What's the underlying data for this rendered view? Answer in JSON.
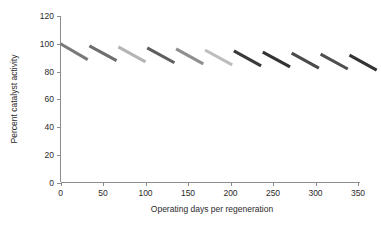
{
  "chart_data": {
    "type": "line",
    "title": "",
    "xlabel": "Operating days per regeneration",
    "ylabel": "Percent catalyst activity",
    "xlim": [
      0,
      350
    ],
    "ylim": [
      0,
      120
    ],
    "xticks": [
      0,
      50,
      100,
      150,
      200,
      250,
      300,
      350
    ],
    "yticks": [
      0,
      20,
      40,
      60,
      80,
      100,
      120
    ],
    "xtick_labels": [
      "0",
      "50",
      "100",
      "150",
      "200",
      "250",
      "300",
      "350"
    ],
    "ytick_labels": [
      "0",
      "20",
      "40",
      "60",
      "80",
      "100",
      "120"
    ],
    "grid": false,
    "legend": "none",
    "series": [
      {
        "name": "Cycle 1",
        "x": [
          0,
          32
        ],
        "y": [
          100.0,
          88.5
        ],
        "color": "#7a7a7a"
      },
      {
        "name": "Cycle 2",
        "x": [
          34,
          66
        ],
        "y": [
          98.5,
          87.8
        ],
        "color": "#6e6e6e"
      },
      {
        "name": "Cycle 3",
        "x": [
          68,
          100
        ],
        "y": [
          97.8,
          87.0
        ],
        "color": "#b5b5b5"
      },
      {
        "name": "Cycle 4",
        "x": [
          102,
          134
        ],
        "y": [
          97.0,
          86.3
        ],
        "color": "#5e5e5e"
      },
      {
        "name": "Cycle 5",
        "x": [
          136,
          168
        ],
        "y": [
          96.3,
          85.5
        ],
        "color": "#8f8f8f"
      },
      {
        "name": "Cycle 6",
        "x": [
          170,
          202
        ],
        "y": [
          95.5,
          84.8
        ],
        "color": "#bdbdbd"
      },
      {
        "name": "Cycle 7",
        "x": [
          204,
          236
        ],
        "y": [
          94.8,
          84.0
        ],
        "color": "#3a3a3a"
      },
      {
        "name": "Cycle 8",
        "x": [
          238,
          270
        ],
        "y": [
          94.0,
          83.3
        ],
        "color": "#333333"
      },
      {
        "name": "Cycle 9",
        "x": [
          272,
          304
        ],
        "y": [
          93.3,
          82.5
        ],
        "color": "#4a4a4a"
      },
      {
        "name": "Cycle 10",
        "x": [
          306,
          338
        ],
        "y": [
          92.5,
          81.8
        ],
        "color": "#4f4f4f"
      },
      {
        "name": "Cycle 11",
        "x": [
          340,
          372
        ],
        "y": [
          91.8,
          81.0
        ],
        "color": "#333333"
      }
    ]
  },
  "axes": {
    "x_title": "Operating days per regeneration",
    "y_title": "Percent catalyst activity"
  }
}
